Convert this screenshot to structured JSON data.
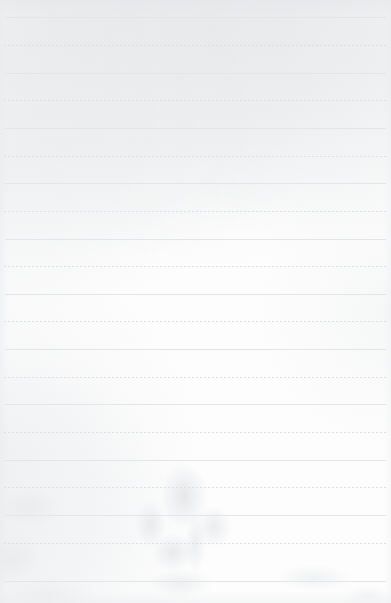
{
  "page": {
    "kind": "lined-paper-sheet",
    "width": 391,
    "height": 603,
    "background_color": "#fdfdfd",
    "texture_color": "#e6e8ea",
    "content_text": "",
    "note": ""
  },
  "ruling": {
    "first_line_y": 17,
    "line_spacing": 27.5,
    "line_count": 21,
    "left_margin": 5,
    "right_margin": 5,
    "solid_color": "#e3e5e8",
    "dashed_color": "#dcdfe3",
    "dash_pattern": "2px 2px",
    "lines": [
      {
        "y": 17,
        "style": "solid",
        "x1": 5,
        "x2": 386
      },
      {
        "y": 45,
        "style": "dashed",
        "x1": 4,
        "x2": 387
      },
      {
        "y": 73,
        "style": "solid",
        "x1": 5,
        "x2": 386
      },
      {
        "y": 100,
        "style": "dashed",
        "x1": 4,
        "x2": 387
      },
      {
        "y": 128,
        "style": "solid",
        "x1": 5,
        "x2": 386
      },
      {
        "y": 156,
        "style": "dashed",
        "x1": 4,
        "x2": 387
      },
      {
        "y": 183,
        "style": "solid",
        "x1": 5,
        "x2": 386
      },
      {
        "y": 211,
        "style": "dashed",
        "x1": 4,
        "x2": 387
      },
      {
        "y": 239,
        "style": "solid",
        "x1": 5,
        "x2": 386
      },
      {
        "y": 266,
        "style": "dashed",
        "x1": 4,
        "x2": 387
      },
      {
        "y": 294,
        "style": "solid",
        "x1": 5,
        "x2": 386
      },
      {
        "y": 321,
        "style": "dashed",
        "x1": 4,
        "x2": 387
      },
      {
        "y": 349,
        "style": "solid",
        "x1": 5,
        "x2": 386
      },
      {
        "y": 377,
        "style": "dashed",
        "x1": 4,
        "x2": 387
      },
      {
        "y": 404,
        "style": "solid",
        "x1": 5,
        "x2": 386
      },
      {
        "y": 432,
        "style": "dashed",
        "x1": 4,
        "x2": 387
      },
      {
        "y": 460,
        "style": "solid",
        "x1": 5,
        "x2": 386
      },
      {
        "y": 487,
        "style": "dashed",
        "x1": 4,
        "x2": 387
      },
      {
        "y": 515,
        "style": "solid",
        "x1": 5,
        "x2": 386
      },
      {
        "y": 543,
        "style": "dashed",
        "x1": 4,
        "x2": 387
      },
      {
        "y": 581,
        "style": "solid",
        "x1": 5,
        "x2": 386
      }
    ]
  }
}
